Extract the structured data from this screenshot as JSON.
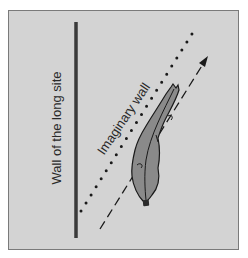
{
  "figure": {
    "labels": {
      "wall_of_long_side": "Wall of the long site",
      "imaginary_wall": "Imaginary wall"
    },
    "colors": {
      "background": "#d3d3d3",
      "frame_border": "#7a7a7a",
      "wall_bar": "#3a3a3a",
      "swimmer_fill": "#8a8a8a",
      "outline": "#1a1a1a",
      "text": "#2a2a2a"
    },
    "elements": [
      {
        "name": "wall-bar",
        "type": "solid-vertical-line"
      },
      {
        "name": "imaginary-wall",
        "type": "dotted-diagonal-line"
      },
      {
        "name": "swim-direction-arrow",
        "type": "dashed-arrow"
      },
      {
        "name": "swimmer",
        "type": "silhouette-top-view"
      }
    ]
  }
}
